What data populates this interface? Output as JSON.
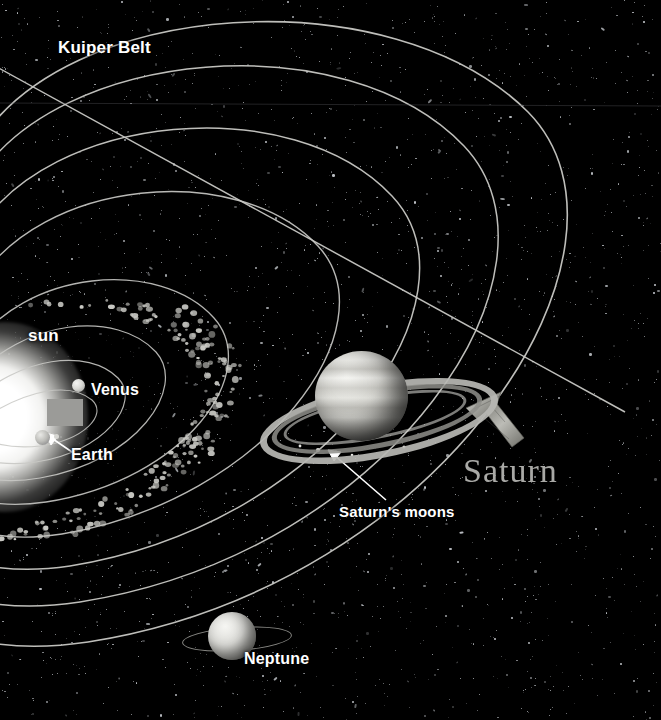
{
  "scene": {
    "title": "Solar System Diagram",
    "background_color": "#000000",
    "star_color": "#cfd3d8",
    "orbit_color": "#c8c8c4"
  },
  "labels": {
    "kuiper_belt": "Kuiper Belt",
    "sun": "sun",
    "venus": "Venus",
    "earth": "Earth",
    "saturns_moons": "Saturn's moons",
    "saturn": "Saturn",
    "neptune": "Neptune"
  },
  "objects": {
    "sun": {
      "name": "sun",
      "x": 5,
      "y": 417,
      "kind": "star",
      "color": "#ffffff"
    },
    "venus": {
      "name": "Venus",
      "x": 78,
      "y": 385,
      "kind": "planet",
      "color": "#d8d8d4"
    },
    "earth": {
      "name": "Earth",
      "x": 42,
      "y": 437,
      "kind": "planet",
      "color": "#bdbdb9"
    },
    "saturn": {
      "name": "Saturn",
      "x": 362,
      "y": 396,
      "kind": "ringed-planet",
      "color": "#d3d3ce"
    },
    "neptune": {
      "name": "Neptune",
      "x": 232,
      "y": 636,
      "kind": "ringed-planet",
      "color": "#dcdcd8"
    }
  },
  "annotations": {
    "asteroid_belt": "asteroid belt",
    "kuiper_belt_line": "kuiper-belt-boundary",
    "moons_pointer": "saturns-moons-pointer",
    "stone_arrow": "stone-arrow-pointer",
    "grey_block": "grey-callout-block"
  },
  "chart_data": {
    "type": "scatter",
    "orbits": [
      {
        "name": "Mercury",
        "label": ""
      },
      {
        "name": "Venus",
        "label": "Venus"
      },
      {
        "name": "Earth",
        "label": "Earth"
      },
      {
        "name": "Mars",
        "label": ""
      },
      {
        "name": "Jupiter",
        "label": ""
      },
      {
        "name": "Saturn",
        "label": "Saturn"
      },
      {
        "name": "Uranus",
        "label": ""
      },
      {
        "name": "Neptune",
        "label": "Neptune"
      }
    ],
    "annotations": [
      "Kuiper Belt",
      "sun",
      "Venus",
      "Earth",
      "Saturn's moons",
      "Saturn",
      "Neptune"
    ]
  }
}
